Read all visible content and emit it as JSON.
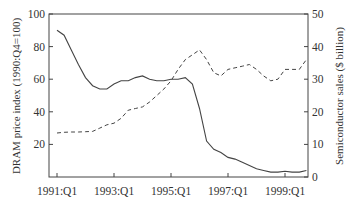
{
  "chart_data": {
    "type": "line",
    "title": "",
    "xlabel": "",
    "ylabel_left": "DRAM price index (1990:Q4=100)",
    "ylabel_right": "Semiconductor sales ($ billion)",
    "ylim_left": [
      0,
      100
    ],
    "ylim_right": [
      0,
      50
    ],
    "yticks_left": [
      20,
      40,
      60,
      80,
      100
    ],
    "yticks_right": [
      0,
      10,
      20,
      30,
      40,
      50
    ],
    "xtick_labels": [
      "1991:Q1",
      "1993:Q1",
      "1995:Q1",
      "1997:Q1",
      "1999:Q1"
    ],
    "grid": false,
    "legend": null,
    "x": [
      "1991:Q1",
      "1991:Q2",
      "1991:Q3",
      "1991:Q4",
      "1992:Q1",
      "1992:Q2",
      "1992:Q3",
      "1992:Q4",
      "1993:Q1",
      "1993:Q2",
      "1993:Q3",
      "1993:Q4",
      "1994:Q1",
      "1994:Q2",
      "1994:Q3",
      "1994:Q4",
      "1995:Q1",
      "1995:Q2",
      "1995:Q3",
      "1995:Q4",
      "1996:Q1",
      "1996:Q2",
      "1996:Q3",
      "1996:Q4",
      "1997:Q1",
      "1997:Q2",
      "1997:Q3",
      "1997:Q4",
      "1998:Q1",
      "1998:Q2",
      "1998:Q3",
      "1998:Q4",
      "1999:Q1",
      "1999:Q2",
      "1999:Q3",
      "1999:Q4"
    ],
    "series": [
      {
        "name": "DRAM price index",
        "axis": "left",
        "style": "solid",
        "values": [
          90,
          87,
          78,
          69,
          61,
          56,
          54,
          54,
          57,
          59,
          59,
          61,
          62,
          60,
          59,
          59,
          60,
          60,
          61,
          57,
          42,
          22,
          17,
          15,
          12,
          11,
          9,
          7,
          5,
          4,
          3,
          3,
          3.5,
          3,
          3,
          4
        ]
      },
      {
        "name": "Semiconductor sales",
        "axis": "right",
        "style": "dashed",
        "values": [
          13.5,
          13.7,
          13.8,
          13.8,
          13.9,
          14,
          15,
          16,
          16.5,
          18,
          20.5,
          21,
          21.5,
          23,
          25,
          27,
          29.5,
          33,
          36,
          37.5,
          39,
          36,
          32,
          31,
          33,
          33.5,
          34,
          34.5,
          33,
          31,
          29.5,
          30,
          33,
          33,
          33,
          36
        ]
      }
    ]
  }
}
